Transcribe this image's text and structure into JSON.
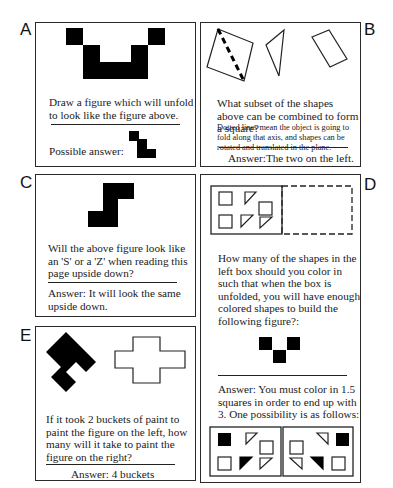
{
  "panels": {
    "A": {
      "label": "A",
      "question": "Draw a figure which will unfold to look like the figure above.",
      "answer_label": "Possible answer:"
    },
    "B": {
      "label": "B",
      "question": "What subset of the shapes above can be combined to form a square?",
      "note": "Dotted lines mean the object is going to fold along that axis, and shapes can be rotated and translated in the plane.",
      "answer": "Answer:The two on the left."
    },
    "C": {
      "label": "C",
      "question": "Will the above figure look like an 'S' or a 'Z' when reading this page upside down?",
      "answer": "Answer: It will look the same upside down."
    },
    "D": {
      "label": "D",
      "question": "How many of the shapes in the left box should you color in such that when the box is unfolded, you will have enough colored shapes to build the following figure?:",
      "answer": "Answer: You must color in 1.5 squares in order to end up with 3. One possibility is as follows:"
    },
    "E": {
      "label": "E",
      "question": "If it took 2 buckets of paint to paint the figure on the left, how many will it take to paint the figure on the right?",
      "answer": "Answer: 4 buckets"
    }
  }
}
